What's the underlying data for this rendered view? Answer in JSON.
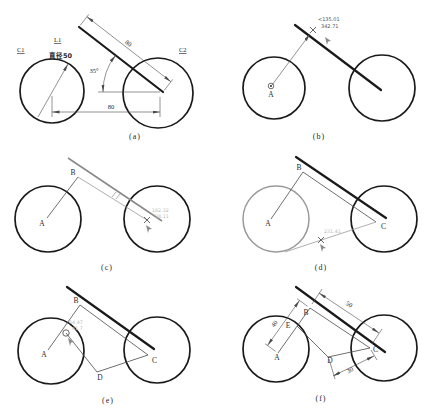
{
  "figure_title": "two-circles-and-tangent-line construction steps",
  "colors": {
    "ink": "#1a1a1a",
    "thin_line": "#4a4a4a",
    "gray": "#9a9a9a",
    "faint_tip": "#b9b9b9"
  },
  "panels": {
    "a": {
      "caption": "(a)",
      "labels": {
        "circle1": "C1",
        "circle2": "C2",
        "line": "L1",
        "diameter": "直径50",
        "angle": "35°",
        "line_length": "80",
        "center_distance": "80"
      }
    },
    "b": {
      "caption": "(b)",
      "labels": {
        "point_a": "A",
        "tooltip_angle": "<135.01",
        "tooltip_length": "342.71"
      }
    },
    "c": {
      "caption": "(c)",
      "labels": {
        "point_a": "A",
        "point_b": "B",
        "tooltip_line1": "182.32",
        "tooltip_line2": "38.11"
      }
    },
    "d": {
      "caption": "(d)",
      "labels": {
        "point_a": "A",
        "point_b": "B",
        "point_c": "C",
        "tooltip": "231.41"
      }
    },
    "e": {
      "caption": "(e)",
      "labels": {
        "point_a": "A",
        "point_b": "B",
        "point_c": "C",
        "point_d": "D",
        "tooltip_line1": "64.47",
        "tooltip_line2": "41.7"
      }
    },
    "f": {
      "caption": "(f)",
      "labels": {
        "point_a": "A",
        "point_b": "B",
        "point_c": "C",
        "point_d": "D",
        "point_e": "E",
        "dim_ab": "40",
        "dim_bc": "50",
        "dim_dc": "30"
      }
    }
  }
}
